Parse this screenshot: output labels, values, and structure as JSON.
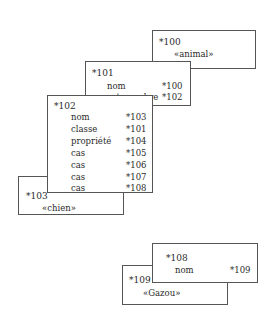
{
  "nodes": {
    "n100": {
      "id": "*100",
      "value": "«animal»"
    },
    "n101": {
      "id": "*101",
      "slots": [
        {
          "key": "nom",
          "ref": "*100"
        },
        {
          "key": "est-membre",
          "ref": "*102"
        }
      ]
    },
    "n102": {
      "id": "*102",
      "slots": [
        {
          "key": "nom",
          "ref": "*103"
        },
        {
          "key": "classe",
          "ref": "*101"
        },
        {
          "key": "propriété",
          "ref": "*104"
        },
        {
          "key": "cas",
          "ref": "*105"
        },
        {
          "key": "cas",
          "ref": "*106"
        },
        {
          "key": "cas",
          "ref": "*107"
        },
        {
          "key": "cas",
          "ref": "*108"
        }
      ]
    },
    "n103": {
      "id": "*103",
      "value": "«chien»"
    },
    "n108": {
      "id": "*108",
      "slots": [
        {
          "key": "nom",
          "ref": "*109"
        }
      ]
    },
    "n109": {
      "id": "*109",
      "value": "«Gazou»"
    }
  }
}
